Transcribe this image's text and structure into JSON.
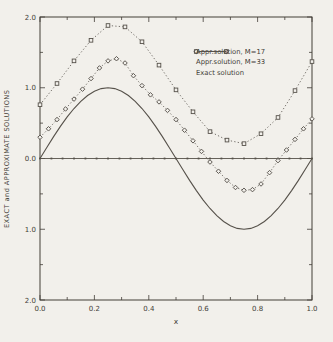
{
  "figure": {
    "background": "#f2f0eb",
    "ink": "#433e37",
    "line_color": "#56514a"
  },
  "legend": {
    "position": "top-right",
    "items": [
      {
        "label": "Appr.solution, M=17",
        "marker": "square",
        "line": "dotted"
      },
      {
        "label": "Appr.solution, M=33",
        "marker": "diamond",
        "line": "dotted"
      },
      {
        "label": "Exact solution",
        "marker": "none",
        "line": "solid"
      }
    ]
  },
  "chart_data": {
    "type": "line",
    "title": "",
    "xlabel": "x",
    "ylabel": "EXACT and APPROXIMATE SOLUTIONS",
    "xlim": [
      0,
      1
    ],
    "ylim": [
      -2,
      2
    ],
    "grid": false,
    "frame": "box-with-inward-ticks",
    "x_major_ticks": [
      0,
      0.2,
      0.4,
      0.6,
      0.8,
      1
    ],
    "x_tick_labels": [
      "0.0",
      "0.2",
      "0.4",
      "0.6",
      "0.8",
      "1.0"
    ],
    "x_minor_step": 0.1,
    "y_major_ticks": [
      2,
      1,
      0,
      -1,
      -2
    ],
    "y_tick_labels": [
      "2.0",
      "1.0",
      "0.0",
      "1.0",
      "2.0"
    ],
    "y_minor_step": 0.5,
    "legend_position": "top-right",
    "y_zero_line": {
      "show": true,
      "value": 0,
      "dot_x": [
        0,
        0.042,
        0.083,
        0.125,
        0.167,
        0.208,
        0.25,
        0.292,
        0.333,
        0.375,
        0.417,
        0.458,
        0.5,
        0.542,
        0.583,
        0.625,
        0.667,
        0.708,
        0.75,
        0.792,
        0.833,
        0.875,
        0.917,
        0.958,
        1
      ]
    },
    "series": [
      {
        "name": "Appr.solution, M=17",
        "marker": "square",
        "line_style": "dotted",
        "x": [
          0,
          0.0625,
          0.125,
          0.1875,
          0.25,
          0.3125,
          0.375,
          0.4375,
          0.5,
          0.5625,
          0.625,
          0.6875,
          0.75,
          0.8125,
          0.875,
          0.9375,
          1
        ],
        "values": [
          0.76,
          1.06,
          1.38,
          1.67,
          1.88,
          1.86,
          1.65,
          1.32,
          0.97,
          0.66,
          0.38,
          0.26,
          0.21,
          0.35,
          0.58,
          0.96,
          1.37
        ]
      },
      {
        "name": "Appr.solution, M=33",
        "marker": "diamond",
        "line_style": "dotted",
        "x": [
          0,
          0.03125,
          0.0625,
          0.09375,
          0.125,
          0.15625,
          0.1875,
          0.21875,
          0.25,
          0.28125,
          0.3125,
          0.34375,
          0.375,
          0.40625,
          0.4375,
          0.46875,
          0.5,
          0.53125,
          0.5625,
          0.59375,
          0.625,
          0.65625,
          0.6875,
          0.71875,
          0.75,
          0.78125,
          0.8125,
          0.84375,
          0.875,
          0.90625,
          0.9375,
          0.96875,
          1
        ],
        "values": [
          0.3,
          0.42,
          0.55,
          0.7,
          0.84,
          0.98,
          1.13,
          1.28,
          1.38,
          1.41,
          1.35,
          1.17,
          1.03,
          0.9,
          0.8,
          0.68,
          0.55,
          0.4,
          0.25,
          0.1,
          -0.05,
          -0.18,
          -0.31,
          -0.41,
          -0.45,
          -0.44,
          -0.36,
          -0.2,
          -0.03,
          0.12,
          0.27,
          0.42,
          0.56
        ]
      },
      {
        "name": "Exact solution",
        "marker": "none",
        "line_style": "solid",
        "x": [
          0,
          0.025,
          0.05,
          0.075,
          0.1,
          0.125,
          0.15,
          0.175,
          0.2,
          0.225,
          0.25,
          0.275,
          0.3,
          0.325,
          0.35,
          0.375,
          0.4,
          0.425,
          0.45,
          0.475,
          0.5,
          0.525,
          0.55,
          0.575,
          0.6,
          0.625,
          0.65,
          0.675,
          0.7,
          0.725,
          0.75,
          0.775,
          0.8,
          0.825,
          0.85,
          0.875,
          0.9,
          0.925,
          0.95,
          0.975,
          1
        ],
        "values": [
          0,
          0.156,
          0.309,
          0.454,
          0.588,
          0.707,
          0.809,
          0.891,
          0.951,
          0.988,
          1,
          0.988,
          0.951,
          0.891,
          0.809,
          0.707,
          0.588,
          0.454,
          0.309,
          0.156,
          0,
          -0.156,
          -0.309,
          -0.454,
          -0.588,
          -0.707,
          -0.809,
          -0.891,
          -0.951,
          -0.988,
          -1,
          -0.988,
          -0.951,
          -0.891,
          -0.809,
          -0.707,
          -0.588,
          -0.454,
          -0.309,
          -0.156,
          0
        ]
      }
    ]
  }
}
